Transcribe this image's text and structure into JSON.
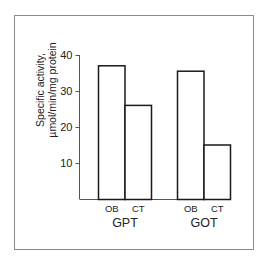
{
  "chart_data": {
    "type": "bar",
    "title": "",
    "xlabel": "",
    "ylabel": "Specific activity, µmol/min/mg protein",
    "ylabel_lines": [
      "Specific activity,",
      "µmol/min/mg protein"
    ],
    "ylim": [
      0,
      40
    ],
    "yticks": [
      10,
      20,
      30,
      40
    ],
    "grid": false,
    "legend": null,
    "groups": [
      {
        "label": "GPT",
        "bars": [
          {
            "category": "OB",
            "value": 37
          },
          {
            "category": "CT",
            "value": 26
          }
        ]
      },
      {
        "label": "GOT",
        "bars": [
          {
            "category": "OB",
            "value": 35.5
          },
          {
            "category": "CT",
            "value": 15
          }
        ]
      }
    ],
    "categories": [
      "OB",
      "CT"
    ],
    "series": [
      {
        "name": "GPT",
        "values": [
          37,
          26
        ]
      },
      {
        "name": "GOT",
        "values": [
          35.5,
          15
        ]
      }
    ]
  },
  "colors": {
    "frame": "#8a8a8a",
    "bar_stroke": "#1a1a1a",
    "bar_fill": "#ffffff",
    "axis": "#555555",
    "text": "#222222"
  }
}
